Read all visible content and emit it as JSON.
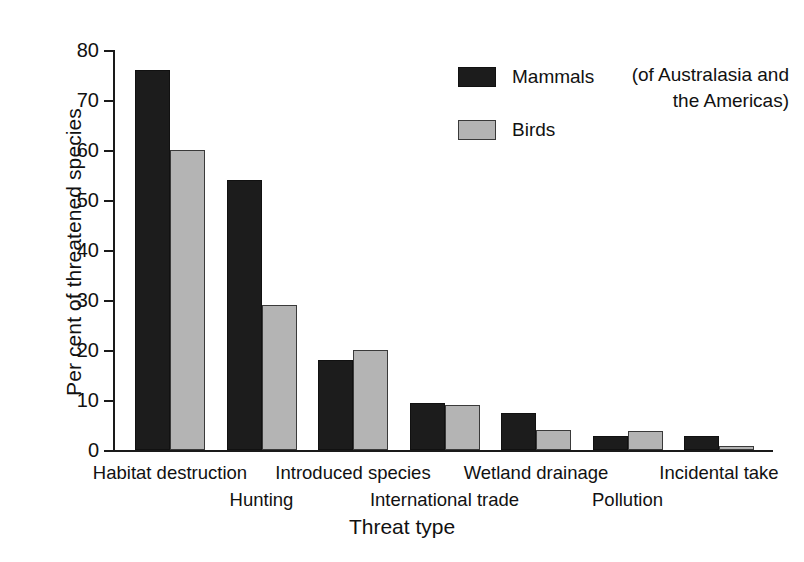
{
  "chart_data": {
    "type": "bar",
    "title": "",
    "xlabel": "Threat type",
    "ylabel": "Per cent of threatened species",
    "ylim": [
      0,
      80
    ],
    "ytick_step": 10,
    "yticks": [
      "0",
      "10",
      "20",
      "30",
      "40",
      "50",
      "60",
      "70",
      "80"
    ],
    "grid": false,
    "legend_position": "top-center-right",
    "categories": [
      "Habitat destruction",
      "Hunting",
      "Introduced species",
      "International trade",
      "Wetland drainage",
      "Pollution",
      "Incidental take"
    ],
    "category_rows": [
      0,
      1,
      0,
      1,
      0,
      1,
      0
    ],
    "series": [
      {
        "name": "Mammals",
        "color": "#1c1c1c",
        "values": [
          76,
          54,
          18,
          9.5,
          7.5,
          2.8,
          2.8
        ]
      },
      {
        "name": "Birds",
        "color": "#b4b4b4",
        "values": [
          60,
          29,
          20,
          9,
          4,
          3.8,
          0.8
        ]
      }
    ],
    "annotations": [
      "(of Australasia and the Americas)"
    ]
  },
  "legend": {
    "items": [
      {
        "label": "Mammals",
        "swatch": "mammals"
      },
      {
        "label": "Birds",
        "swatch": "birds"
      }
    ],
    "note_line_1": "(of Australasia and",
    "note_line_2": "the Americas)"
  },
  "colors": {
    "mammals": "#1c1c1c",
    "birds": "#b4b4b4",
    "axis": "#1a1a1a",
    "text": "#111111",
    "background": "#ffffff"
  }
}
